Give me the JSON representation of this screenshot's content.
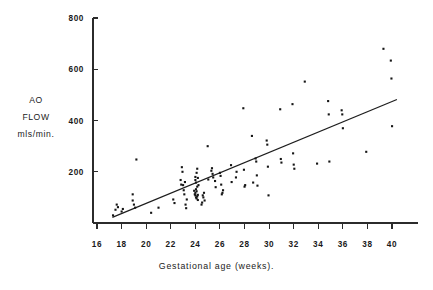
{
  "chart_data": {
    "type": "scatter",
    "title": "",
    "xlabel": "Gestational age (weeks).",
    "ylabel_lines": [
      "AO",
      "FLOW",
      "mls/min."
    ],
    "ylabel": "AO FLOW mls/min.",
    "xlim": [
      14.7,
      41.3
    ],
    "ylim": [
      0,
      800
    ],
    "xticks": [
      16,
      18,
      20,
      22,
      24,
      26,
      28,
      30,
      32,
      34,
      36,
      38,
      40
    ],
    "xticklabels": [
      "16",
      "18",
      "20",
      "22",
      "24",
      "26",
      "28",
      "30",
      "32",
      "34",
      "36",
      "38",
      "40"
    ],
    "yticks": [
      200,
      400,
      600,
      800
    ],
    "yticklabels": [
      "200",
      "400",
      "600",
      "800"
    ],
    "grid": false,
    "legend": null,
    "marker": "square-dot",
    "marker_color": "#151515",
    "series": [
      {
        "name": "AO flow measurements",
        "points": [
          [
            17.3,
            30
          ],
          [
            17.5,
            52
          ],
          [
            17.6,
            72
          ],
          [
            17.7,
            62
          ],
          [
            18.0,
            45
          ],
          [
            18.1,
            55
          ],
          [
            18.9,
            112
          ],
          [
            18.9,
            88
          ],
          [
            19.0,
            72
          ],
          [
            19.1,
            60
          ],
          [
            19.2,
            248
          ],
          [
            20.4,
            40
          ],
          [
            21.0,
            60
          ],
          [
            22.2,
            92
          ],
          [
            22.3,
            78
          ],
          [
            22.8,
            168
          ],
          [
            22.85,
            150
          ],
          [
            22.9,
            218
          ],
          [
            22.95,
            200
          ],
          [
            23.0,
            148
          ],
          [
            23.05,
            128
          ],
          [
            23.1,
            112
          ],
          [
            23.15,
            160
          ],
          [
            23.2,
            72
          ],
          [
            23.25,
            58
          ],
          [
            23.3,
            92
          ],
          [
            23.9,
            126
          ],
          [
            23.95,
            112
          ],
          [
            24.0,
            108
          ],
          [
            24.0,
            118
          ],
          [
            24.05,
            100
          ],
          [
            24.05,
            132
          ],
          [
            24.1,
            96
          ],
          [
            24.1,
            124
          ],
          [
            24.15,
            104
          ],
          [
            24.15,
            142
          ],
          [
            24.2,
            110
          ],
          [
            24.2,
            90
          ],
          [
            24.0,
            168
          ],
          [
            24.0,
            180
          ],
          [
            24.05,
            158
          ],
          [
            24.1,
            196
          ],
          [
            24.15,
            212
          ],
          [
            24.2,
            176
          ],
          [
            24.25,
            148
          ],
          [
            24.5,
            72
          ],
          [
            24.55,
            80
          ],
          [
            24.6,
            108
          ],
          [
            24.65,
            100
          ],
          [
            24.7,
            118
          ],
          [
            24.75,
            88
          ],
          [
            25.0,
            300
          ],
          [
            25.05,
            170
          ],
          [
            25.3,
            204
          ],
          [
            25.35,
            214
          ],
          [
            25.4,
            192
          ],
          [
            25.45,
            178
          ],
          [
            25.6,
            164
          ],
          [
            25.65,
            140
          ],
          [
            26.0,
            196
          ],
          [
            26.05,
            184
          ],
          [
            26.1,
            150
          ],
          [
            26.15,
            112
          ],
          [
            26.2,
            118
          ],
          [
            26.25,
            128
          ],
          [
            26.9,
            226
          ],
          [
            26.95,
            160
          ],
          [
            27.3,
            178
          ],
          [
            27.35,
            200
          ],
          [
            27.9,
            448
          ],
          [
            27.95,
            208
          ],
          [
            28.0,
            142
          ],
          [
            28.05,
            148
          ],
          [
            28.6,
            340
          ],
          [
            28.7,
            158
          ],
          [
            28.9,
            252
          ],
          [
            28.95,
            240
          ],
          [
            29.0,
            186
          ],
          [
            29.05,
            146
          ],
          [
            29.8,
            322
          ],
          [
            29.85,
            306
          ],
          [
            29.9,
            220
          ],
          [
            29.95,
            108
          ],
          [
            30.9,
            444
          ],
          [
            30.95,
            250
          ],
          [
            31.0,
            236
          ],
          [
            31.9,
            464
          ],
          [
            31.95,
            272
          ],
          [
            32.0,
            228
          ],
          [
            32.05,
            212
          ],
          [
            32.9,
            552
          ],
          [
            33.9,
            232
          ],
          [
            34.8,
            476
          ],
          [
            34.85,
            424
          ],
          [
            34.9,
            240
          ],
          [
            35.9,
            440
          ],
          [
            35.95,
            424
          ],
          [
            36.0,
            370
          ],
          [
            37.9,
            278
          ],
          [
            39.3,
            680
          ],
          [
            39.9,
            634
          ],
          [
            39.95,
            564
          ],
          [
            40.0,
            378
          ]
        ]
      }
    ],
    "fit_line": {
      "name": "regression line",
      "x_start": 17.25,
      "y_start": 22,
      "x_end": 40.4,
      "y_end": 482
    }
  },
  "axes": {
    "y_axis_name": "y-axis",
    "x_axis_name": "x-axis"
  }
}
